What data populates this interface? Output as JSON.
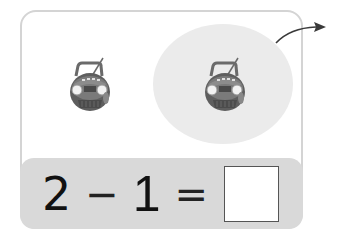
{
  "worksheet": {
    "type": "subtraction-picture-problem",
    "objects": [
      {
        "name": "boombox",
        "group": "remaining",
        "icon": "boombox-icon"
      },
      {
        "name": "boombox",
        "group": "taken-away",
        "icon": "boombox-icon",
        "highlighted": true
      }
    ],
    "equation": {
      "minuend": "2",
      "operator": "−",
      "subtrahend": "1",
      "equals": "=",
      "answer": ""
    },
    "colors": {
      "card_border": "#d4d4d4",
      "band": "#d9d9d9",
      "highlight_ellipse": "#ebebeb",
      "arrow": "#3a3a3a",
      "boombox_body": "#5a5a5a"
    }
  }
}
